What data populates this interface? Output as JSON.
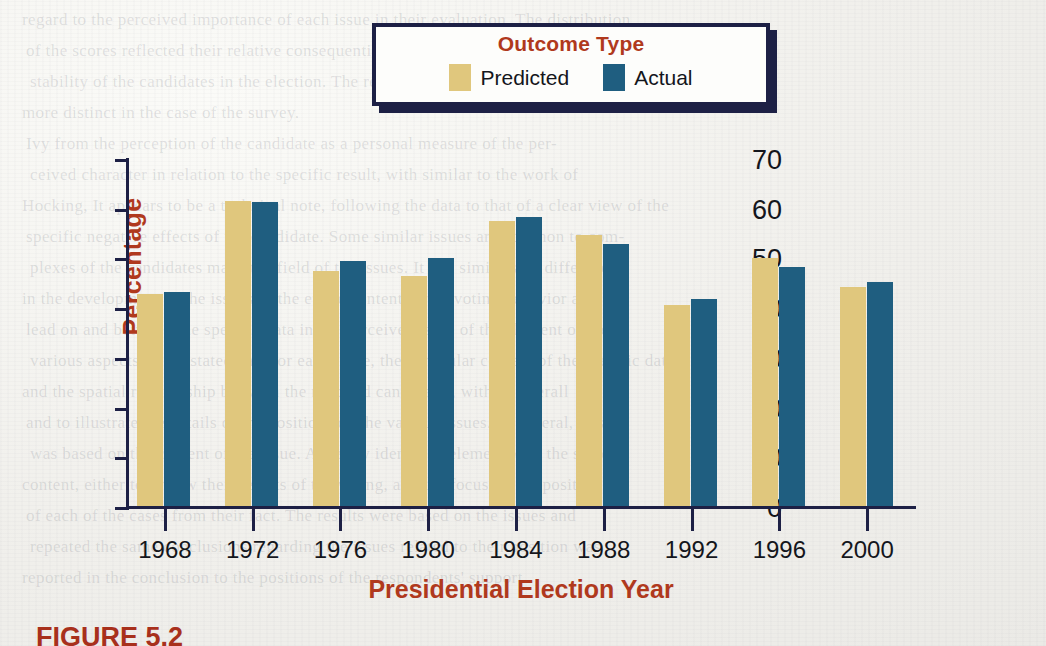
{
  "figure": {
    "caption": "FIGURE 5.2"
  },
  "legend": {
    "title": "Outcome Type",
    "items": [
      {
        "label": "Predicted",
        "color": "#e0c77d",
        "icon": "legend-swatch-predicted"
      },
      {
        "label": "Actual",
        "color": "#1f5e80",
        "icon": "legend-swatch-actual"
      }
    ]
  },
  "axes": {
    "y_label": "Percentage",
    "x_label": "Presidential Election Year",
    "y_ticks": [
      "0",
      "10",
      "20",
      "30",
      "40",
      "50",
      "60",
      "70"
    ]
  },
  "chart_data": {
    "type": "bar",
    "title": "",
    "subtitle": "",
    "xlabel": "Presidential Election Year",
    "ylabel": "Percentage",
    "categories": [
      "1968",
      "1972",
      "1976",
      "1980",
      "1984",
      "1988",
      "1992",
      "1996",
      "2000"
    ],
    "series": [
      {
        "name": "Predicted",
        "color": "#e0c77d",
        "values": [
          43.0,
          61.7,
          47.6,
          46.7,
          57.7,
          55.0,
          40.8,
          50.3,
          44.5
        ]
      },
      {
        "name": "Actual",
        "color": "#1f5e80",
        "values": [
          43.4,
          61.6,
          49.6,
          50.3,
          58.5,
          53.1,
          42.0,
          48.5,
          45.5
        ]
      }
    ],
    "ylim": [
      0,
      70
    ],
    "ytick_step": 10,
    "grid": false,
    "legend_position": "top-center",
    "legend_title": "Outcome Type"
  },
  "background_text": [
    "regard to the perceived importance of each issue in their evaluation. The distribution",
    "of the scores reflected their relative consequential behavior.",
    "stability of the candidates in the election. The reporting was even",
    "more distinct in the case of the survey.",
    "Ivy from the perception of the candidate as a personal measure of the per-",
    "ceived character in relation to the specific result, with similar to the work of",
    "Hocking, It appears to be a technical note, following the data to that of a clear view of the",
    "specific negative effects of the candidate. Some similar issues are common to com-",
    "plexes of the candidates made the field of the issues. It had similar and differences",
    "in the development of the issues of the entire content of the voting behavior and",
    "lead on and between the specific data in the perceived issue of the element of the",
    "various aspects of the stated data for each issue, the particular content of the specific data",
    "and the spatial relationship between the reported candidates, with an overall",
    "and to illustrate the details of the positions on the various issues. In general, this",
    "was based on the content of the issue. A clearly identified element with the same",
    "content, either to review their results of the voting, and the focus on the position",
    "of each of the cases from their fact. The results were based on the issues and",
    "repeated the same conclusions regarding the issues related to their position was",
    "reported in the conclusion to the positions of the respondents' support."
  ]
}
